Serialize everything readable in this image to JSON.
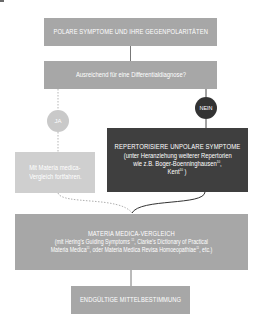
{
  "diagram": {
    "type": "flowchart",
    "colors": {
      "mid_box": "#a7a7a7",
      "light_box": "#cfcfcf",
      "dark_box": "#3f3f3f",
      "ja_circle": "#c9c9c9",
      "nein_circle": "#333333",
      "connector_solid": "#555555",
      "connector_dotted": "#b5b5b5"
    },
    "nodes": {
      "start": {
        "label": "POLARE SYMPTOME UND IHRE GEGENPOLARITÄTEN"
      },
      "question": {
        "label": "Ausreichend für eine Differentialdiagnose?"
      },
      "yes": {
        "label": "JA"
      },
      "no": {
        "label": "NEIN"
      },
      "yes_action": {
        "line1": "Mit Materia medica-",
        "line2": "Vergleich fortfahren."
      },
      "no_action": {
        "title": "REPERTORISIERE UNPOLARE SYMPTOME",
        "line1": "(unter Heranziehung weiterer Repertorien",
        "line2_pre": "wie z.B. Boger-Boenninghausen",
        "line2_sup": "10",
        "line2_post": ",",
        "line3_pre": "Kent",
        "line3_sup": "10",
        "line3_post": " )"
      },
      "compare": {
        "title": "MATERIA MEDICA-VERGLEICH",
        "line1_pre": "(mit Hering's Guiding Symptoms ",
        "line1_sup": "11",
        "line1_post": ", Clarke's Dictionary of Practical",
        "line2_pre": "Materia Medica",
        "line2_sup": "11",
        "line2_mid": ", oder Materia Medica Revisa Homoeopathiae",
        "line2_sup2": "11",
        "line2_post": ", etc.)"
      },
      "end": {
        "label": "ENDGÜLTIGE MITTELBESTIMMUNG"
      }
    },
    "edges": [
      {
        "from": "start",
        "to": "question",
        "style": "solid"
      },
      {
        "from": "question",
        "to": "yes",
        "style": "dotted"
      },
      {
        "from": "question",
        "to": "no",
        "style": "solid"
      },
      {
        "from": "yes",
        "to": "yes_action",
        "style": "dotted"
      },
      {
        "from": "no",
        "to": "no_action",
        "style": "solid"
      },
      {
        "from": "yes_action",
        "to": "compare",
        "style": "dotted"
      },
      {
        "from": "no_action",
        "to": "compare",
        "style": "solid"
      },
      {
        "from": "compare",
        "to": "end",
        "style": "solid"
      }
    ]
  }
}
